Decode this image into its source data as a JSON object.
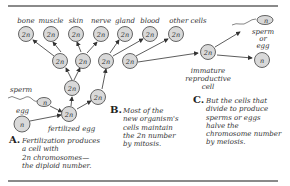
{
  "diagram": {
    "top_labels": [
      "bone",
      "muscle",
      "skin",
      "nerve",
      "gland",
      "blood",
      "other cells"
    ],
    "diploid_label": "2n",
    "haploid_label": "n",
    "sperm_label": "sperm",
    "egg_label": "egg",
    "fertilized_label": "fertilized egg",
    "immature_label": [
      "immature",
      "reproductive",
      "cell"
    ],
    "gamete_label": [
      "sperm",
      "or",
      "egg"
    ]
  },
  "captions": {
    "a": {
      "letter": "A.",
      "lines": [
        "Fertilization produces",
        "a cell with",
        "2n chromosomes—",
        "the diploid number."
      ]
    },
    "b": {
      "letter": "B.",
      "lines": [
        "Most of the",
        "new organism's",
        "cells maintain",
        "the 2n number",
        "by mitosis."
      ]
    },
    "c": {
      "letter": "C.",
      "lines": [
        "But the cells that",
        "divide to produce",
        "sperms or eggs",
        "halve the",
        "chromosome number",
        "by meiosis."
      ]
    }
  },
  "colors": {
    "cell_fill": "#d9d9d9",
    "cell_stroke": "#555555",
    "rule": "#8a8a8a"
  }
}
